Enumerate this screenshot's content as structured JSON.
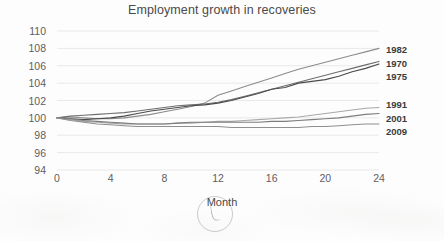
{
  "chart_data": {
    "type": "line",
    "title": "Employment growth in recoveries",
    "xlabel": "Month",
    "ylabel": "",
    "xlim": [
      0,
      24
    ],
    "ylim": [
      94,
      110
    ],
    "xticks": [
      0,
      4,
      8,
      12,
      16,
      20,
      24
    ],
    "yticks": [
      94,
      96,
      98,
      100,
      102,
      104,
      106,
      108,
      110
    ],
    "grid": "horizontal",
    "legend_position": "right-inline",
    "x": [
      0,
      1,
      2,
      3,
      4,
      5,
      6,
      7,
      8,
      9,
      10,
      11,
      12,
      13,
      14,
      15,
      16,
      17,
      18,
      19,
      20,
      21,
      22,
      23,
      24
    ],
    "series": [
      {
        "name": "1982",
        "color": "#8c8c8c",
        "label_value": "1982",
        "values": [
          100.0,
          100.1,
          100.0,
          99.9,
          99.9,
          100.0,
          100.2,
          100.4,
          100.7,
          101.0,
          101.3,
          101.7,
          102.6,
          103.1,
          103.6,
          104.1,
          104.6,
          105.1,
          105.6,
          106.0,
          106.4,
          106.8,
          107.2,
          107.6,
          108.0
        ]
      },
      {
        "name": "1970",
        "color": "#6e6e6e",
        "label_value": "1970",
        "values": [
          100.0,
          100.2,
          100.3,
          100.4,
          100.5,
          100.6,
          100.8,
          101.0,
          101.2,
          101.4,
          101.5,
          101.6,
          101.8,
          102.1,
          102.5,
          102.9,
          103.3,
          103.7,
          104.1,
          104.5,
          104.9,
          105.3,
          105.7,
          106.1,
          106.5
        ]
      },
      {
        "name": "1975",
        "color": "#4a4a4a",
        "label_value": "1975",
        "values": [
          100.0,
          99.9,
          99.8,
          99.9,
          100.0,
          100.2,
          100.5,
          100.8,
          101.0,
          101.2,
          101.4,
          101.5,
          101.7,
          102.0,
          102.4,
          102.8,
          103.3,
          103.5,
          104.0,
          104.2,
          104.4,
          104.8,
          105.3,
          105.7,
          106.2
        ]
      },
      {
        "name": "1991",
        "color": "#a8a8a8",
        "label_value": "1991",
        "values": [
          100.0,
          99.8,
          99.6,
          99.5,
          99.4,
          99.3,
          99.3,
          99.3,
          99.3,
          99.4,
          99.4,
          99.5,
          99.6,
          99.6,
          99.7,
          99.8,
          99.9,
          100.0,
          100.1,
          100.3,
          100.5,
          100.7,
          100.9,
          101.1,
          101.2
        ]
      },
      {
        "name": "2001",
        "color": "#7d7d7d",
        "label_value": "2001",
        "values": [
          100.0,
          99.9,
          99.7,
          99.6,
          99.5,
          99.4,
          99.3,
          99.3,
          99.3,
          99.4,
          99.5,
          99.5,
          99.5,
          99.5,
          99.5,
          99.5,
          99.6,
          99.6,
          99.7,
          99.8,
          99.9,
          100.0,
          100.2,
          100.4,
          100.5
        ]
      },
      {
        "name": "2009",
        "color": "#8f8f8f",
        "label_value": "2009",
        "values": [
          100.0,
          99.7,
          99.5,
          99.3,
          99.2,
          99.1,
          99.0,
          99.0,
          99.0,
          99.0,
          99.0,
          99.0,
          99.0,
          98.9,
          98.9,
          98.9,
          98.9,
          98.9,
          98.9,
          99.0,
          99.0,
          99.1,
          99.2,
          99.3,
          99.3
        ]
      }
    ],
    "series_label_positions": [
      {
        "name": "1982",
        "label": "1982",
        "top": 49
      },
      {
        "name": "1970",
        "label": "1970",
        "top": 63
      },
      {
        "name": "1975",
        "label": "1975",
        "top": 76
      },
      {
        "name": "1991",
        "label": "1991",
        "top": 104
      },
      {
        "name": "2001",
        "label": "2001",
        "top": 118
      },
      {
        "name": "2009",
        "label": "2009",
        "top": 131
      }
    ]
  }
}
